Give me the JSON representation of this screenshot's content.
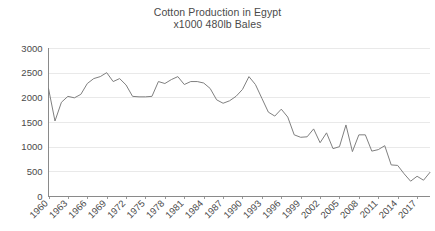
{
  "chart_data": {
    "type": "line",
    "title": "Cotton Production in Egypt",
    "subtitle": "x1000 480lb Bales",
    "xlabel": "",
    "ylabel": "",
    "ylim": [
      0,
      3000
    ],
    "xlim": [
      1960,
      2019
    ],
    "ytick_values": [
      0,
      500,
      1000,
      1500,
      2000,
      2500,
      3000
    ],
    "ytick_labels": [
      "0",
      "500",
      "1000",
      "1500",
      "2000",
      "2500",
      "3000"
    ],
    "xtick_labels": [
      "1960",
      "1963",
      "1966",
      "1969",
      "1972",
      "1975",
      "1978",
      "1981",
      "1984",
      "1987",
      "1990",
      "1993",
      "1996",
      "1999",
      "2002",
      "2005",
      "2008",
      "2011",
      "2014",
      "2017"
    ],
    "xtick_values": [
      1960,
      1963,
      1966,
      1969,
      1972,
      1975,
      1978,
      1981,
      1984,
      1987,
      1990,
      1993,
      1996,
      1999,
      2002,
      2005,
      2008,
      2011,
      2014,
      2017
    ],
    "xtick_rotation": 45,
    "grid": true,
    "grid_axis": "y",
    "legend": false,
    "legend_position": "none",
    "line_color": "#808080",
    "grid_color": "#e9e9e9",
    "axis_color": "#8a8a8a",
    "x": [
      1960,
      1961,
      1962,
      1963,
      1964,
      1965,
      1966,
      1967,
      1968,
      1969,
      1970,
      1971,
      1972,
      1973,
      1974,
      1975,
      1976,
      1977,
      1978,
      1979,
      1980,
      1981,
      1982,
      1983,
      1984,
      1985,
      1986,
      1987,
      1988,
      1989,
      1990,
      1991,
      1992,
      1993,
      1994,
      1995,
      1996,
      1997,
      1998,
      1999,
      2000,
      2001,
      2002,
      2003,
      2004,
      2005,
      2006,
      2007,
      2008,
      2009,
      2010,
      2011,
      2012,
      2013,
      2014,
      2015,
      2016,
      2017,
      2018,
      2019
    ],
    "series": [
      {
        "name": "Cotton Production",
        "values": [
          2180,
          1520,
          1900,
          2020,
          1990,
          2060,
          2280,
          2380,
          2420,
          2500,
          2320,
          2380,
          2250,
          2020,
          2010,
          2010,
          2020,
          2320,
          2280,
          2360,
          2420,
          2260,
          2320,
          2320,
          2290,
          2180,
          1950,
          1880,
          1930,
          2020,
          2160,
          2420,
          2260,
          1980,
          1700,
          1620,
          1760,
          1600,
          1240,
          1190,
          1200,
          1360,
          1080,
          1280,
          960,
          1000,
          1440,
          900,
          1240,
          1240,
          910,
          940,
          1020,
          630,
          620,
          450,
          300,
          400,
          320,
          480
        ]
      }
    ]
  }
}
